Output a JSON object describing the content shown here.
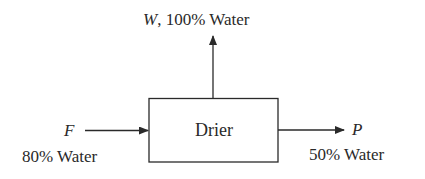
{
  "diagram": {
    "type": "process-flow",
    "unit": {
      "name": "Drier"
    },
    "streams": [
      {
        "id": "feed",
        "symbol": "F",
        "composition": "80% Water",
        "direction": "in",
        "position": "left"
      },
      {
        "id": "water",
        "symbol": "W",
        "composition": "100% Water",
        "label": "W, 100% Water",
        "separator": ", ",
        "direction": "out",
        "position": "top"
      },
      {
        "id": "product",
        "symbol": "P",
        "composition": "50% Water",
        "direction": "out",
        "position": "right"
      }
    ],
    "colors": {
      "line": "#2a2a2a",
      "text": "#2a2a2a",
      "background": "#ffffff"
    }
  }
}
